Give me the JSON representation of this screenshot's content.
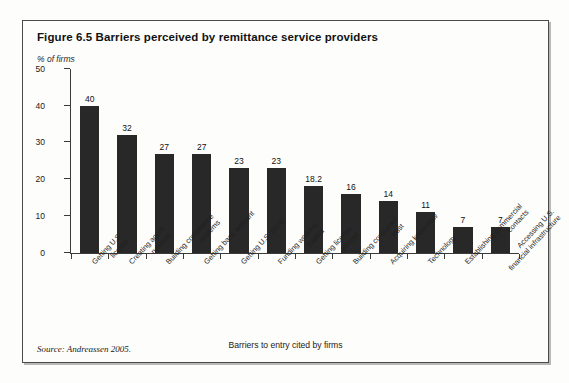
{
  "figure": {
    "title": "Figure 6.5  Barriers perceived by remittance service providers",
    "source": "Source: Andreassen 2005.",
    "bar_color": "#282828",
    "axis_color": "#3a3a3a",
    "border_color": "#4a4a4a"
  },
  "chart_data": {
    "type": "bar",
    "title": "Figure 6.5  Barriers perceived by remittance service providers",
    "subtitle": "",
    "xlabel": "Barriers to entry cited by firms",
    "ylabel": "% of firms",
    "ylim": [
      0,
      50
    ],
    "yticks": [
      0,
      10,
      20,
      30,
      40,
      50
    ],
    "grid": false,
    "legend": false,
    "categories": [
      "Getting U.S. license",
      "Creating agent network",
      "Building compliance systems",
      "Getting bank account",
      "Getting U.S. bond",
      "Funding working capital",
      "Getting license abroad",
      "Building consumer trust",
      "Acquiring know-how",
      "Technology",
      "Establishing commercial contacts",
      "Accessing U.S. financial infrastructure"
    ],
    "category_lines": [
      [
        "Getting U.S.",
        "license"
      ],
      [
        "Creating agent",
        "network"
      ],
      [
        "Building compliance",
        "systems"
      ],
      [
        "Getting bank account",
        ""
      ],
      [
        "Getting U.S. bond",
        ""
      ],
      [
        "Funding working",
        "capital"
      ],
      [
        "Getting license",
        "abroad"
      ],
      [
        "Building consumer",
        "trust"
      ],
      [
        "Acquiring know-how",
        ""
      ],
      [
        "Technology",
        ""
      ],
      [
        "Establishing commercial",
        "contacts"
      ],
      [
        "Accessing U.S.",
        "financial infrastructure"
      ]
    ],
    "values": [
      40,
      32,
      27,
      27,
      23,
      23,
      18.2,
      16,
      14,
      11,
      7,
      7
    ],
    "value_labels": [
      "40",
      "32",
      "27",
      "27",
      "23",
      "23",
      "18.2",
      "16",
      "14",
      "11",
      "7",
      "7"
    ]
  }
}
